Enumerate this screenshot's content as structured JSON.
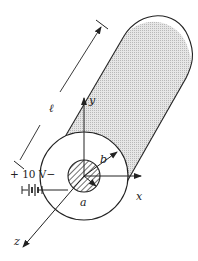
{
  "diagram": {
    "labels": {
      "length": "ℓ",
      "voltage": "+ 10 V−",
      "inner_radius": "a",
      "outer_radius": "b",
      "x_axis": "x",
      "y_axis": "y",
      "z_axis": "z"
    },
    "colors": {
      "stroke": "#222222",
      "shade": "#d4d4d4",
      "background": "#ffffff"
    }
  }
}
